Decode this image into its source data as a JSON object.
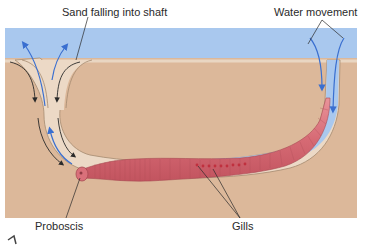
{
  "diagram": {
    "labels": {
      "sand": "Sand falling into shaft",
      "water": "Water movement",
      "proboscis": "Proboscis",
      "gills": "Gills"
    },
    "caption_partial": "Fig..."
  },
  "colors": {
    "water": "#a9c8ee",
    "sand": "#dcb89a",
    "burrow_lining": "#ecd9c6",
    "worm": "#d9707a",
    "arrow_water": "#3a6fd0",
    "arrow_sand": "#2a2a2a"
  }
}
